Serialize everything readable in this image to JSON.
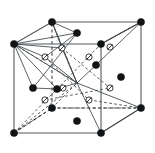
{
  "figure": {
    "background_color": "#ffffff",
    "width": 155,
    "height": 153
  },
  "style": {
    "edge_solid_color": "#555a5e",
    "edge_dashed_color": "#3a3f43",
    "bond_color": "#3f4448",
    "atom_filled_color": "#111315",
    "atom_open_fill": "#ffffff",
    "atom_open_stroke": "#222629",
    "atom_filled_radius": 3.6,
    "atom_open_radius": 3.1
  },
  "chart_data": {
    "type": "scatter",
    "xlabel": "",
    "ylabel": "",
    "projection": "oblique",
    "grid": false,
    "legend": [],
    "cube_vertices": [
      {
        "name": "front-bottom-left",
        "id": "FBL",
        "x": 14,
        "y": 133
      },
      {
        "name": "front-bottom-right",
        "id": "FBR",
        "x": 101,
        "y": 133
      },
      {
        "name": "front-top-left",
        "id": "FTL",
        "x": 14,
        "y": 44
      },
      {
        "name": "front-top-right",
        "id": "FTR",
        "x": 101,
        "y": 44
      },
      {
        "name": "back-bottom-left",
        "id": "BBL",
        "x": 52,
        "y": 108
      },
      {
        "name": "back-bottom-right",
        "id": "BBR",
        "x": 141,
        "y": 108
      },
      {
        "name": "back-top-left",
        "id": "BTL",
        "x": 52,
        "y": 22
      },
      {
        "name": "back-top-right",
        "id": "BTR",
        "x": 141,
        "y": 22
      }
    ],
    "solid_edges": [
      [
        "FTL",
        "FTR"
      ],
      [
        "FTL",
        "FBL"
      ],
      [
        "FTR",
        "FBR"
      ],
      [
        "FBL",
        "FBR"
      ],
      [
        "FTL",
        "BTL"
      ],
      [
        "FTR",
        "BTR"
      ],
      [
        "FBR",
        "BBR"
      ],
      [
        "BTL",
        "BTR"
      ],
      [
        "BTR",
        "BBR"
      ]
    ],
    "dashed_edges": [
      [
        "BBL",
        "BBR"
      ],
      [
        "BBL",
        "BTL"
      ],
      [
        "FBL",
        "BBL"
      ]
    ],
    "corner_atoms": [
      {
        "label": "corner",
        "x": 14,
        "y": 44
      },
      {
        "label": "corner",
        "x": 101,
        "y": 44
      },
      {
        "label": "corner",
        "x": 52,
        "y": 22
      },
      {
        "label": "corner",
        "x": 141,
        "y": 22
      },
      {
        "label": "corner",
        "x": 14,
        "y": 133
      },
      {
        "label": "corner",
        "x": 101,
        "y": 133
      },
      {
        "label": "corner",
        "x": 52,
        "y": 108
      },
      {
        "label": "corner",
        "x": 141,
        "y": 108
      }
    ],
    "face_center_atoms": [
      {
        "label": "face-centre-top",
        "x": 77,
        "y": 33
      },
      {
        "label": "face-centre-left",
        "x": 33,
        "y": 88
      },
      {
        "label": "face-centre-front",
        "x": 57,
        "y": 89
      },
      {
        "label": "face-centre-right",
        "x": 121,
        "y": 77
      },
      {
        "label": "face-centre-bottom",
        "x": 77,
        "y": 121
      },
      {
        "label": "face-centre-back",
        "x": 96,
        "y": 65
      }
    ],
    "interior_atoms": [
      {
        "label": "interior-slashed",
        "x": 62,
        "y": 48
      },
      {
        "label": "interior-slashed",
        "x": 45,
        "y": 57
      },
      {
        "label": "interior-slashed",
        "x": 110,
        "y": 47
      },
      {
        "label": "interior-slashed",
        "x": 89,
        "y": 57
      },
      {
        "label": "interior-slashed",
        "x": 63,
        "y": 88
      },
      {
        "label": "interior-slashed",
        "x": 45,
        "y": 100
      },
      {
        "label": "interior-slashed",
        "x": 110,
        "y": 88
      },
      {
        "label": "interior-slashed",
        "x": 89,
        "y": 100
      }
    ],
    "solid_bonds": [
      {
        "from": [
          14,
          44
        ],
        "to": [
          77,
          33
        ]
      },
      {
        "from": [
          14,
          44
        ],
        "to": [
          62,
          48
        ]
      },
      {
        "from": [
          14,
          44
        ],
        "to": [
          45,
          57
        ]
      },
      {
        "from": [
          14,
          44
        ],
        "to": [
          33,
          88
        ]
      },
      {
        "from": [
          14,
          44
        ],
        "to": [
          57,
          89
        ]
      },
      {
        "from": [
          14,
          44
        ],
        "to": [
          77,
          83
        ]
      },
      {
        "from": [
          52,
          22
        ],
        "to": [
          77,
          33
        ]
      },
      {
        "from": [
          52,
          22
        ],
        "to": [
          62,
          48
        ]
      },
      {
        "from": [
          52,
          22
        ],
        "to": [
          77,
          83
        ]
      },
      {
        "from": [
          77,
          33
        ],
        "to": [
          45,
          57
        ]
      },
      {
        "from": [
          77,
          33
        ],
        "to": [
          33,
          88
        ]
      },
      {
        "from": [
          33,
          88
        ],
        "to": [
          57,
          89
        ]
      },
      {
        "from": [
          57,
          89
        ],
        "to": [
          77,
          83
        ]
      },
      {
        "from": [
          62,
          48
        ],
        "to": [
          77,
          83
        ]
      },
      {
        "from": [
          45,
          57
        ],
        "to": [
          77,
          83
        ]
      },
      {
        "from": [
          101,
          44
        ],
        "to": [
          141,
          22
        ]
      },
      {
        "from": [
          77,
          83
        ],
        "to": [
          141,
          22
        ]
      },
      {
        "from": [
          77,
          83
        ],
        "to": [
          101,
          133
        ]
      },
      {
        "from": [
          77,
          83
        ],
        "to": [
          141,
          108
        ]
      },
      {
        "from": [
          101,
          133
        ],
        "to": [
          141,
          108
        ]
      }
    ],
    "dashed_bonds": [
      {
        "from": [
          14,
          133
        ],
        "to": [
          52,
          108
        ]
      },
      {
        "from": [
          14,
          133
        ],
        "to": [
          77,
          83
        ]
      },
      {
        "from": [
          14,
          133
        ],
        "to": [
          101,
          44
        ]
      },
      {
        "from": [
          52,
          108
        ],
        "to": [
          77,
          83
        ]
      },
      {
        "from": [
          77,
          83
        ],
        "to": [
          52,
          22
        ]
      },
      {
        "from": [
          77,
          83
        ],
        "to": [
          14,
          44
        ]
      },
      {
        "from": [
          101,
          44
        ],
        "to": [
          141,
          22
        ]
      },
      {
        "from": [
          52,
          108
        ],
        "to": [
          141,
          108
        ]
      },
      {
        "from": [
          89,
          100
        ],
        "to": [
          141,
          108
        ]
      },
      {
        "from": [
          45,
          100
        ],
        "to": [
          110,
          88
        ]
      },
      {
        "from": [
          62,
          48
        ],
        "to": [
          110,
          88
        ]
      },
      {
        "from": [
          45,
          57
        ],
        "to": [
          89,
          100
        ]
      }
    ]
  }
}
